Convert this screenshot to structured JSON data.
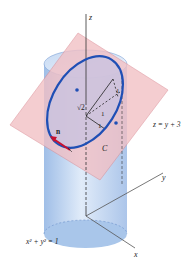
{
  "diagram": {
    "axes": {
      "z": "z",
      "y": "y",
      "x": "x"
    },
    "plane_label": "z = y + 3",
    "cylinder_label": "x² + y² = 1",
    "curve_label": "C",
    "normal_label": "n",
    "segment_labels": {
      "sqrt2": "√2",
      "one_a": "1",
      "one_b": "1",
      "one_c": "1"
    },
    "colors": {
      "cylinder": "#a9c6ea",
      "plane": "#f2bfc4",
      "ellipse": "#1f4fb5",
      "normal": "#c8102e",
      "axis": "#333333"
    }
  }
}
